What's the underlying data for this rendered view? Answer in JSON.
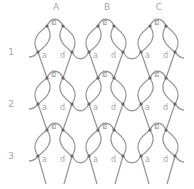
{
  "columns": [
    {
      "label": "A",
      "x": 56
    },
    {
      "label": "B",
      "x": 107
    },
    {
      "label": "C",
      "x": 159
    }
  ],
  "rows": [
    {
      "label": "1",
      "y": 52
    },
    {
      "label": "2",
      "y": 104
    },
    {
      "label": "3",
      "y": 156
    }
  ],
  "point_labels": [
    "a",
    "b",
    "c",
    "d"
  ],
  "colors": {
    "strand": "#9a9a9a",
    "dot": "#666666",
    "text": "#a8a8a8"
  }
}
